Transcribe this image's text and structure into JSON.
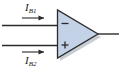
{
  "figure": {
    "kind": "op-amp-bias-current-diagram",
    "width": 121,
    "height": 69,
    "background_color": "#ffffff"
  },
  "opamp": {
    "name": "operational-amplifier",
    "shape": "triangle",
    "fill_color": "#c3d2e6",
    "stroke_color": "#2b2b2b",
    "shadow_color": "#9aa3ae",
    "inverting_symbol": "−",
    "noninverting_symbol": "+",
    "symbol_color": "#2b2b2b"
  },
  "labels": {
    "inverting_current": {
      "symbol": "I",
      "subscript": "B1"
    },
    "noninverting_current": {
      "symbol": "I",
      "subscript": "B2"
    }
  },
  "wires": {
    "inverting_input": {
      "name": "inverting-input-wire",
      "color": "#2b2b2b"
    },
    "noninverting_input": {
      "name": "noninverting-input-wire",
      "color": "#2b2b2b"
    },
    "output": {
      "name": "output-wire",
      "color": "#2b2b2b"
    }
  },
  "arrows": {
    "inverting_current_arrow": {
      "name": "current-arrow-ib1",
      "direction": "right",
      "color": "#2b2b2b"
    },
    "noninverting_current_arrow": {
      "name": "current-arrow-ib2",
      "direction": "right",
      "color": "#2b2b2b"
    }
  }
}
